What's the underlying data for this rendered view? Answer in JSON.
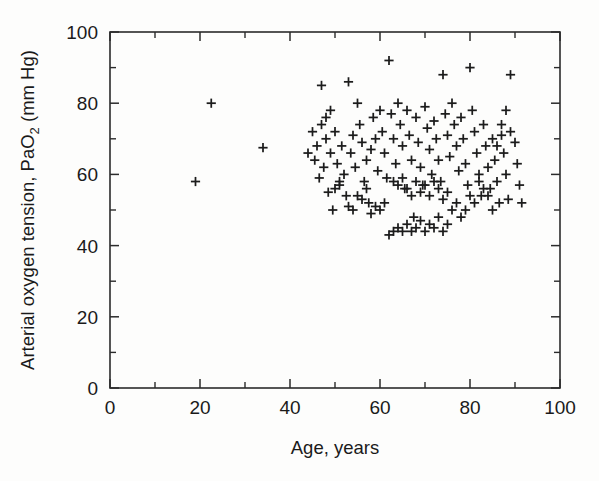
{
  "chart_data": {
    "type": "scatter",
    "title": "",
    "xlabel": "Age, years",
    "ylabel_parts": {
      "pre": "Arterial oxygen tension, PaO",
      "sub": "2",
      "post": " (mm Hg)"
    },
    "ylabel": "Arterial oxygen tension, PaO2 (mm Hg)",
    "xlim": [
      0,
      100
    ],
    "ylim": [
      0,
      100
    ],
    "xticks": [
      0,
      20,
      40,
      60,
      80,
      100
    ],
    "yticks": [
      0,
      20,
      40,
      60,
      80,
      100
    ],
    "xticklabels": [
      "0",
      "20",
      "40",
      "60",
      "80",
      "100"
    ],
    "yticklabels": [
      "0",
      "20",
      "40",
      "60",
      "80",
      "100"
    ],
    "xminor_ticks": [
      10,
      30,
      50,
      70,
      90
    ],
    "yminor_ticks": [
      10,
      30,
      50,
      70,
      90
    ],
    "grid": false,
    "legend": null,
    "marker": "plus",
    "marker_color": "#1c1c1c",
    "frame_color": "#2b2b2b",
    "background_color": "#fdfdfc",
    "series": [
      {
        "name": "patients",
        "points": [
          [
            19,
            58
          ],
          [
            22.5,
            80
          ],
          [
            34,
            67.5
          ],
          [
            45,
            72
          ],
          [
            45.5,
            64
          ],
          [
            46,
            68
          ],
          [
            46.5,
            59
          ],
          [
            47,
            85
          ],
          [
            47.5,
            62
          ],
          [
            48,
            70
          ],
          [
            48.5,
            55
          ],
          [
            49,
            66
          ],
          [
            49.5,
            50
          ],
          [
            50,
            72
          ],
          [
            50.5,
            63
          ],
          [
            51,
            57
          ],
          [
            51.5,
            68
          ],
          [
            52,
            60
          ],
          [
            52.5,
            54
          ],
          [
            53,
            86
          ],
          [
            53.5,
            66
          ],
          [
            54,
            71
          ],
          [
            54.5,
            62
          ],
          [
            55,
            80
          ],
          [
            55.5,
            74
          ],
          [
            56,
            69
          ],
          [
            56.5,
            58
          ],
          [
            57,
            64
          ],
          [
            57.5,
            52
          ],
          [
            58,
            67
          ],
          [
            58.5,
            76
          ],
          [
            59,
            70
          ],
          [
            59.5,
            61
          ],
          [
            60,
            78
          ],
          [
            60.5,
            72
          ],
          [
            61,
            66
          ],
          [
            61.5,
            59
          ],
          [
            62,
            92
          ],
          [
            62.5,
            77
          ],
          [
            63,
            70
          ],
          [
            63.5,
            63
          ],
          [
            64,
            80
          ],
          [
            64.5,
            74
          ],
          [
            65,
            68
          ],
          [
            65.5,
            56
          ],
          [
            66,
            78
          ],
          [
            66.5,
            71
          ],
          [
            67,
            64
          ],
          [
            67.5,
            48
          ],
          [
            68,
            76
          ],
          [
            68.5,
            69
          ],
          [
            69,
            62
          ],
          [
            69.5,
            57
          ],
          [
            70,
            79
          ],
          [
            70.5,
            73
          ],
          [
            71,
            67
          ],
          [
            71.5,
            60
          ],
          [
            72,
            75
          ],
          [
            72.5,
            70
          ],
          [
            73,
            64
          ],
          [
            73.5,
            58
          ],
          [
            74,
            88
          ],
          [
            74.5,
            77
          ],
          [
            75,
            71
          ],
          [
            75.5,
            65
          ],
          [
            76,
            80
          ],
          [
            76.5,
            74
          ],
          [
            77,
            68
          ],
          [
            77.5,
            61
          ],
          [
            78,
            76
          ],
          [
            78.5,
            70
          ],
          [
            79,
            63
          ],
          [
            79.5,
            57
          ],
          [
            80,
            90
          ],
          [
            80.5,
            78
          ],
          [
            81,
            72
          ],
          [
            81.5,
            66
          ],
          [
            82,
            60
          ],
          [
            82.5,
            54
          ],
          [
            83,
            74
          ],
          [
            83.5,
            68
          ],
          [
            84,
            62
          ],
          [
            84.5,
            56
          ],
          [
            85,
            70
          ],
          [
            85.5,
            64
          ],
          [
            86,
            58
          ],
          [
            86.5,
            52
          ],
          [
            87,
            71
          ],
          [
            87.5,
            66
          ],
          [
            88,
            60
          ],
          [
            88.5,
            53
          ],
          [
            89,
            88
          ],
          [
            90,
            69
          ],
          [
            90.5,
            63
          ],
          [
            91,
            57
          ],
          [
            91.5,
            52
          ],
          [
            62,
            43
          ],
          [
            63,
            44
          ],
          [
            64,
            45
          ],
          [
            65,
            44
          ],
          [
            66,
            46
          ],
          [
            67,
            44
          ],
          [
            68,
            45
          ],
          [
            69,
            47
          ],
          [
            70,
            44
          ],
          [
            71,
            46
          ],
          [
            72,
            45
          ],
          [
            73,
            48
          ],
          [
            74,
            44
          ],
          [
            75,
            46
          ],
          [
            60,
            50
          ],
          [
            61,
            52
          ],
          [
            53,
            51
          ],
          [
            54,
            50
          ],
          [
            55,
            54
          ],
          [
            56,
            53
          ],
          [
            50,
            56
          ],
          [
            51,
            58
          ],
          [
            58,
            49
          ],
          [
            59,
            51
          ],
          [
            76,
            50
          ],
          [
            77,
            52
          ],
          [
            78,
            48
          ],
          [
            79,
            50
          ],
          [
            80,
            54
          ],
          [
            81,
            52
          ],
          [
            66,
            56
          ],
          [
            67,
            54
          ],
          [
            68,
            58
          ],
          [
            69,
            55
          ],
          [
            70,
            57
          ],
          [
            71,
            54
          ],
          [
            72,
            58
          ],
          [
            73,
            56
          ],
          [
            74,
            53
          ],
          [
            75,
            55
          ],
          [
            82,
            58
          ],
          [
            83,
            56
          ],
          [
            84,
            54
          ],
          [
            85,
            50
          ],
          [
            63,
            58
          ],
          [
            64,
            57
          ],
          [
            65,
            59
          ],
          [
            57,
            56
          ],
          [
            47,
            74
          ],
          [
            48,
            76
          ],
          [
            49,
            78
          ],
          [
            44,
            66
          ],
          [
            86,
            68
          ],
          [
            87,
            74
          ],
          [
            88,
            78
          ],
          [
            89,
            72
          ]
        ]
      }
    ]
  }
}
